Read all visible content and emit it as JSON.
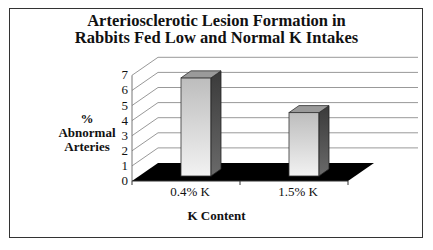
{
  "chart_data": {
    "type": "bar",
    "style": "3d-column",
    "title": "Arteriosclerotic Lesion Formation in Rabbits Fed Low and Normal K Intakes",
    "title_lines": [
      "Arteriosclerotic Lesion Formation in",
      "Rabbits Fed Low and Normal K Intakes"
    ],
    "xlabel": "K Content",
    "ylabel": "% Abnormal Arteries",
    "ylabel_lines": [
      "%",
      "Abnormal",
      "Arteries"
    ],
    "categories": [
      "0.4% K",
      "1.5% K"
    ],
    "values": [
      6.5,
      4.2
    ],
    "ylim": [
      0,
      7
    ],
    "yticks": [
      "0",
      "1",
      "2",
      "3",
      "4",
      "5",
      "6",
      "7"
    ],
    "grid": true,
    "legend": "none",
    "colors": {
      "bar_front": "#d8d8d8",
      "bar_side": "#4a4a4a",
      "bar_top": "#9a9a9a",
      "floor": "#000000",
      "grid": "#999999",
      "frame": "#333333"
    }
  }
}
